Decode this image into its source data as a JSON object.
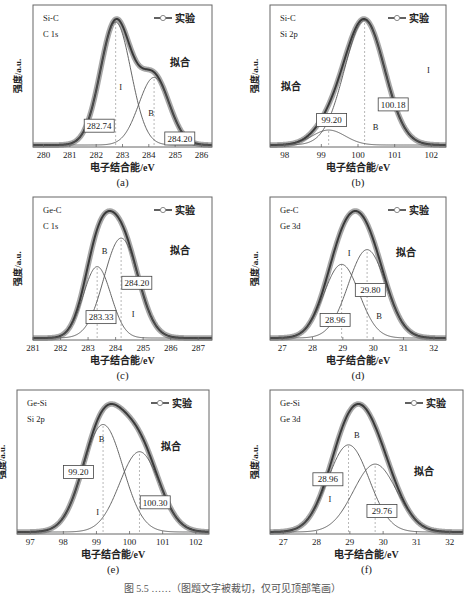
{
  "figure": {
    "caption": "图 5.5  ……（图题文字被裁切，仅可见顶部笔画）",
    "legend_experiment": "实验",
    "fit_label": "拟合",
    "ylabel": "强度/a.u.",
    "xlabel": "电子结合能/eV",
    "colors": {
      "experiment": "#8a8a8a",
      "fit": "#3a3a3a",
      "component": "#555555",
      "frame": "#666666",
      "dashed": "#9a9a9a"
    }
  },
  "chart_data": [
    {
      "id": "a",
      "type": "line",
      "sublabel": "(a)",
      "title_line1": "Si-C",
      "title_line2": "C 1s",
      "xlabel": "电子结合能/eV",
      "ylabel": "强度/a.u.",
      "xlim": [
        279.6,
        286.4
      ],
      "xticks": [
        280,
        281,
        282,
        283,
        284,
        285,
        286
      ],
      "legend": [
        "实验",
        "拟合"
      ],
      "components": [
        {
          "name": "I",
          "center": 282.74,
          "height": 1.0,
          "sigma": 0.58,
          "label": "282.74"
        },
        {
          "name": "B",
          "center": 284.2,
          "height": 0.55,
          "sigma": 0.58,
          "label": "284.20"
        }
      ],
      "annotations": [
        "I",
        "B",
        "拟合",
        "282.74",
        "284.20"
      ]
    },
    {
      "id": "b",
      "type": "line",
      "sublabel": "(b)",
      "title_line1": "Si-C",
      "title_line2": "Si 2p",
      "xlabel": "电子结合能/eV",
      "ylabel": "强度/a.u.",
      "xlim": [
        97.6,
        102.4
      ],
      "xticks": [
        98,
        99,
        100,
        101,
        102
      ],
      "legend": [
        "实验",
        "拟合"
      ],
      "components": [
        {
          "name": "I",
          "center": 100.18,
          "height": 1.0,
          "sigma": 0.55,
          "label": "100.18"
        },
        {
          "name": "B",
          "center": 99.2,
          "height": 0.12,
          "sigma": 0.45,
          "label": "99.20"
        }
      ],
      "annotations": [
        "I",
        "B",
        "拟合",
        "100.18",
        "99.20"
      ]
    },
    {
      "id": "c",
      "type": "line",
      "sublabel": "(c)",
      "title_line1": "Ge-C",
      "title_line2": "C 1s",
      "xlabel": "电子结合能/eV",
      "ylabel": "强度/a.u.",
      "xlim": [
        281.0,
        287.5
      ],
      "xticks": [
        281,
        282,
        283,
        284,
        285,
        286,
        287
      ],
      "legend": [
        "实验",
        "拟合"
      ],
      "components": [
        {
          "name": "B",
          "center": 284.2,
          "height": 0.77,
          "sigma": 0.62,
          "label": "284.20"
        },
        {
          "name": "I",
          "center": 283.33,
          "height": 0.55,
          "sigma": 0.5,
          "label": "283.33"
        }
      ],
      "annotations": [
        "B",
        "I",
        "拟合",
        "284.20",
        "283.33"
      ]
    },
    {
      "id": "d",
      "type": "line",
      "sublabel": "(d)",
      "title_line1": "Ge-C",
      "title_line2": "Ge 3d",
      "xlabel": "电子结合能/eV",
      "ylabel": "强度/a.u.",
      "xlim": [
        26.6,
        32.4
      ],
      "xticks": [
        27,
        28,
        29,
        30,
        31,
        32
      ],
      "legend": [
        "实验",
        "拟合"
      ],
      "components": [
        {
          "name": "I",
          "center": 29.8,
          "height": 0.72,
          "sigma": 0.62,
          "label": "29.80"
        },
        {
          "name": "B",
          "center": 28.96,
          "height": 0.6,
          "sigma": 0.58,
          "label": "28.96"
        }
      ],
      "annotations": [
        "I",
        "B",
        "拟合",
        "29.80",
        "28.96"
      ]
    },
    {
      "id": "e",
      "type": "line",
      "sublabel": "(e)",
      "title_line1": "Ge-Si",
      "title_line2": "Si 2p",
      "xlabel": "电子结合能/eV",
      "ylabel": "强度/a.u.",
      "xlim": [
        96.6,
        102.4
      ],
      "xticks": [
        97,
        98,
        99,
        100,
        101,
        102
      ],
      "legend": [
        "实验",
        "拟合"
      ],
      "components": [
        {
          "name": "B",
          "center": 99.2,
          "height": 0.83,
          "sigma": 0.6,
          "label": "99.20"
        },
        {
          "name": "I",
          "center": 100.3,
          "height": 0.62,
          "sigma": 0.6,
          "label": "100.30"
        }
      ],
      "annotations": [
        "B",
        "I",
        "拟合",
        "99.20",
        "100.30"
      ]
    },
    {
      "id": "f",
      "type": "line",
      "sublabel": "(f)",
      "title_line1": "Ge-Si",
      "title_line2": "Ge 3d",
      "xlabel": "电子结合能/eV",
      "ylabel": "强度/a.u.",
      "xlim": [
        26.6,
        32.4
      ],
      "xticks": [
        27,
        28,
        29,
        30,
        31,
        32
      ],
      "legend": [
        "实验",
        "拟合"
      ],
      "components": [
        {
          "name": "B",
          "center": 28.96,
          "height": 0.77,
          "sigma": 0.62,
          "label": "28.96"
        },
        {
          "name": "I",
          "center": 29.76,
          "height": 0.6,
          "sigma": 0.65,
          "label": "29.76"
        }
      ],
      "annotations": [
        "B",
        "I",
        "拟合",
        "28.96",
        "29.76"
      ]
    }
  ],
  "layout": [
    {
      "id": "a",
      "left": 33,
      "top": 5,
      "w": 179,
      "h": 142,
      "lbl": [
        {
          "text": "I",
          "x": 0.49,
          "y": 0.6
        },
        {
          "text": "B",
          "x": 0.66,
          "y": 0.78
        },
        {
          "text": "fit",
          "x": 0.82,
          "y": 0.43
        }
      ],
      "boxes": [
        {
          "ci": 0,
          "x": 0.37,
          "y": 0.85
        },
        {
          "ci": 1,
          "x": 0.82,
          "y": 0.94
        }
      ]
    },
    {
      "id": "b",
      "left": 270,
      "top": 5,
      "w": 176,
      "h": 142,
      "lbl": [
        {
          "text": "I",
          "x": 0.9,
          "y": 0.48
        },
        {
          "text": "B",
          "x": 0.6,
          "y": 0.88
        },
        {
          "text": "fit",
          "x": 0.12,
          "y": 0.6
        }
      ],
      "boxes": [
        {
          "ci": 0,
          "x": 0.7,
          "y": 0.7
        },
        {
          "ci": 1,
          "x": 0.35,
          "y": 0.81
        }
      ]
    },
    {
      "id": "c",
      "left": 33,
      "top": 197,
      "w": 179,
      "h": 143,
      "lbl": [
        {
          "text": "B",
          "x": 0.4,
          "y": 0.4
        },
        {
          "text": "I",
          "x": 0.56,
          "y": 0.84
        },
        {
          "text": "fit",
          "x": 0.82,
          "y": 0.4
        }
      ],
      "boxes": [
        {
          "ci": 0,
          "x": 0.58,
          "y": 0.6
        },
        {
          "ci": 1,
          "x": 0.38,
          "y": 0.84
        }
      ]
    },
    {
      "id": "d",
      "left": 270,
      "top": 197,
      "w": 176,
      "h": 143,
      "lbl": [
        {
          "text": "I",
          "x": 0.45,
          "y": 0.41
        },
        {
          "text": "B",
          "x": 0.62,
          "y": 0.85
        },
        {
          "text": "fit",
          "x": 0.77,
          "y": 0.41
        }
      ],
      "boxes": [
        {
          "ci": 0,
          "x": 0.57,
          "y": 0.65
        },
        {
          "ci": 1,
          "x": 0.37,
          "y": 0.86
        }
      ]
    },
    {
      "id": "e",
      "left": 17,
      "top": 390,
      "w": 192,
      "h": 144,
      "lbl": [
        {
          "text": "B",
          "x": 0.44,
          "y": 0.36
        },
        {
          "text": "I",
          "x": 0.42,
          "y": 0.87
        },
        {
          "text": "fit",
          "x": 0.8,
          "y": 0.42
        }
      ],
      "boxes": [
        {
          "ci": 0,
          "x": 0.32,
          "y": 0.57
        },
        {
          "ci": 1,
          "x": 0.72,
          "y": 0.78
        }
      ]
    },
    {
      "id": "f",
      "left": 270,
      "top": 390,
      "w": 193,
      "h": 144,
      "lbl": [
        {
          "text": "B",
          "x": 0.45,
          "y": 0.33
        },
        {
          "text": "I",
          "x": 0.31,
          "y": 0.78
        },
        {
          "text": "fit",
          "x": 0.8,
          "y": 0.59
        }
      ],
      "boxes": [
        {
          "ci": 0,
          "x": 0.3,
          "y": 0.62
        },
        {
          "ci": 1,
          "x": 0.58,
          "y": 0.84
        }
      ]
    }
  ]
}
